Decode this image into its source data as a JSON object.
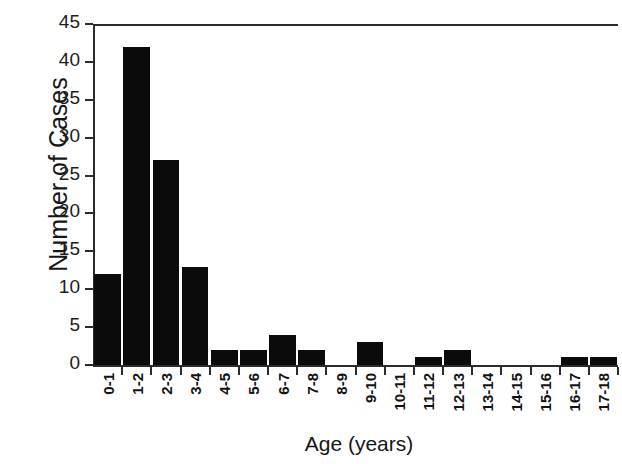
{
  "chart_data": {
    "type": "bar",
    "title": "",
    "xlabel": "Age (years)",
    "ylabel": "Number of Cases",
    "categories": [
      "0-1",
      "1-2",
      "2-3",
      "3-4",
      "4-5",
      "5-6",
      "6-7",
      "7-8",
      "8-9",
      "9-10",
      "10-11",
      "11-12",
      "12-13",
      "13-14",
      "14-15",
      "15-16",
      "16-17",
      "17-18"
    ],
    "values": [
      12,
      42,
      27,
      13,
      2,
      2,
      4,
      2,
      0,
      3,
      0,
      1,
      2,
      0,
      0,
      0,
      1,
      1
    ],
    "ylim": [
      0,
      45
    ],
    "yticks": [
      0,
      5,
      10,
      15,
      20,
      25,
      30,
      35,
      40,
      45
    ],
    "ytick_labels": [
      "0",
      "5",
      "10",
      "15",
      "20",
      "25",
      "30",
      "35",
      "40",
      "45"
    ],
    "grid": false,
    "legend": null,
    "bar_color": "#0b0b0b",
    "axis_color": "#2b2b2b",
    "background": "#ffffff"
  }
}
